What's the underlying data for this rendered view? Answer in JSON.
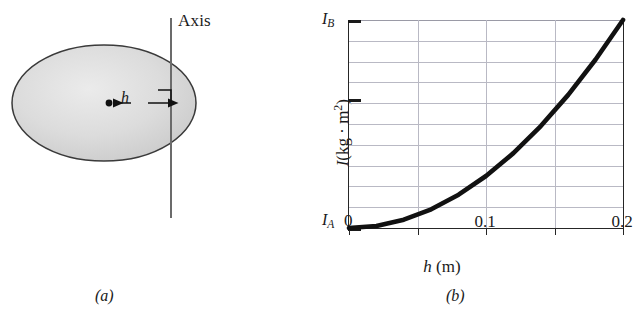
{
  "figure": {
    "panel_a": {
      "caption": "(a)",
      "axis_label": "Axis",
      "distance_label": "h",
      "shape": "ellipse",
      "shape_fill_color": "#d8d8d8",
      "shape_stroke_color": "#3a3a3a",
      "axis_line_color": "#6a6a6a",
      "center_dot_name": "center-of-mass-dot",
      "right_angle_marker": true
    },
    "panel_b": {
      "caption": "(b)",
      "y_axis_top_label": "I",
      "y_axis_top_label_sub": "B",
      "y_axis_bottom_label": "I",
      "y_axis_bottom_label_sub": "A",
      "x_origin_label": "0"
    }
  },
  "chart_data": {
    "type": "line",
    "title": "",
    "xlabel_parts": {
      "symbol": "h",
      "unit": "(m)"
    },
    "ylabel_parts": {
      "symbol": "I",
      "unit": "(kg · m",
      "unit_sup": "2",
      "unit_close": ")"
    },
    "xlabel": "h (m)",
    "ylabel": "I (kg · m²)",
    "xlim": [
      0,
      0.2
    ],
    "ylim_labels": [
      "I_A",
      "I_B"
    ],
    "x_tick_values": [
      0,
      0.05,
      0.1,
      0.15,
      0.2
    ],
    "x_tick_labels": [
      "0",
      "",
      "0.1",
      "",
      "0.2"
    ],
    "y_gridline_fractions": [
      0.1,
      0.2,
      0.3,
      0.4,
      0.5,
      0.6,
      0.7,
      0.8,
      0.9
    ],
    "y_major_tick_fractions": [
      0.0,
      0.62,
      1.0
    ],
    "grid": true,
    "legend": false,
    "curve_description": "parabolic increase of moment of inertia with distance h (parallel-axis theorem)",
    "curve_color": "#111111",
    "curve_width_px": 4,
    "x": [
      0,
      0.02,
      0.04,
      0.06,
      0.08,
      0.1,
      0.12,
      0.14,
      0.16,
      0.18,
      0.2
    ],
    "y_fraction_of_range": [
      0.0,
      0.01,
      0.04,
      0.09,
      0.16,
      0.25,
      0.36,
      0.49,
      0.64,
      0.81,
      1.0
    ]
  }
}
